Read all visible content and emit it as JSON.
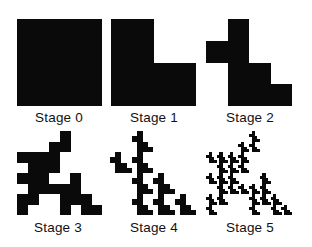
{
  "figure": {
    "ink_color": "#0a0a0a",
    "background_color": "#ffffff",
    "stages": [
      {
        "label": "Stage 0",
        "grid_size": 1,
        "cells": [
          [
            0,
            0
          ]
        ]
      },
      {
        "label": "Stage 1",
        "grid_size": 2,
        "cells": [
          [
            0,
            0
          ],
          [
            1,
            0
          ],
          [
            1,
            1
          ]
        ]
      },
      {
        "label": "Stage 2",
        "grid_size": 4,
        "cells": [
          [
            0,
            1
          ],
          [
            1,
            0
          ],
          [
            1,
            1
          ],
          [
            2,
            1
          ],
          [
            2,
            2
          ],
          [
            3,
            1
          ],
          [
            3,
            2
          ],
          [
            3,
            3
          ]
        ]
      },
      {
        "label": "Stage 3",
        "grid_size": 8,
        "cells": [
          [
            0,
            4
          ],
          [
            1,
            3
          ],
          [
            1,
            4
          ],
          [
            2,
            0
          ],
          [
            2,
            1
          ],
          [
            2,
            2
          ],
          [
            2,
            3
          ],
          [
            3,
            1
          ],
          [
            3,
            2
          ],
          [
            3,
            3
          ],
          [
            4,
            0
          ],
          [
            4,
            1
          ],
          [
            4,
            2
          ],
          [
            4,
            5
          ],
          [
            5,
            1
          ],
          [
            5,
            2
          ],
          [
            5,
            3
          ],
          [
            5,
            4
          ],
          [
            5,
            5
          ],
          [
            6,
            0
          ],
          [
            6,
            1
          ],
          [
            6,
            4
          ],
          [
            6,
            5
          ],
          [
            6,
            6
          ],
          [
            7,
            0
          ],
          [
            7,
            4
          ],
          [
            7,
            6
          ],
          [
            7,
            7
          ]
        ]
      },
      {
        "label": "Stage 4",
        "grid_size": 16,
        "generated_from": "stage-2 motif substituted into stage 2"
      },
      {
        "label": "Stage 5",
        "grid_size": 32,
        "generated_from": "stage-2 motif substituted into stage 3"
      }
    ]
  }
}
